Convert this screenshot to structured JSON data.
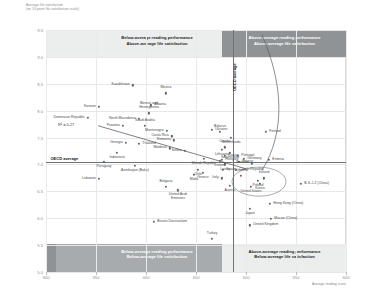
{
  "axis_titles": {
    "y_line1": "Average life satisfaction",
    "y_line2": "(on 10-point life satisfaction scale)",
    "x": "Average reading score"
  },
  "quadrants": {
    "top_left_line1": "Below-average reading performance",
    "top_left_line2": "Above-average life satisfaction",
    "top_right_line1": "Above-average reading performance",
    "top_right_line2": "Above-average life satisfaction",
    "bottom_left_line1": "Below-average reading performance",
    "bottom_left_line2": "Below-average life satisfaction",
    "bottom_right_line1": "Above-average reading performance",
    "bottom_right_line2": "Below-average life satisfaction"
  },
  "reference": {
    "horizontal_label": "OECD average",
    "vertical_label": "OECD average",
    "r_squared_label": "R² = 0.27"
  },
  "chart_data": {
    "type": "scatter",
    "title": "",
    "xlabel": "Average reading score",
    "ylabel": "Average life satisfaction (on 10-point life satisfaction scale)",
    "xlim": [
      300,
      600
    ],
    "ylim": [
      5.0,
      9.5
    ],
    "xticks": [
      300,
      350,
      400,
      450,
      500,
      550,
      600
    ],
    "yticks": [
      5.0,
      5.5,
      6.0,
      6.5,
      7.0,
      7.5,
      8.0,
      8.5,
      9.0,
      9.5
    ],
    "grid": true,
    "legend": "none",
    "oecd_average_x": 487,
    "oecd_average_y": 7.04,
    "trendline": {
      "x0": 352,
      "y0": 7.72,
      "x1": 500,
      "y1": 6.92
    },
    "points": [
      {
        "label": "Kazakhstan",
        "x": 387,
        "y": 8.47,
        "lpos": "r"
      },
      {
        "label": "Mexico",
        "x": 420,
        "y": 8.32,
        "lpos": "c-top"
      },
      {
        "label": "Albania",
        "x": 405,
        "y": 8.1,
        "lpos": "l"
      },
      {
        "label": "Bosnia and Herzegovina",
        "x": 403,
        "y": 7.95,
        "lpos": "c-top2"
      },
      {
        "label": "Kosovo",
        "x": 353,
        "y": 8.07,
        "lpos": "r"
      },
      {
        "label": "Dominican Republic",
        "x": 342,
        "y": 7.87,
        "lpos": "r"
      },
      {
        "label": "North Macedonia",
        "x": 393,
        "y": 7.85,
        "lpos": "r"
      },
      {
        "label": "Panama",
        "x": 377,
        "y": 7.72,
        "lpos": "r"
      },
      {
        "label": "Saudi Arabia",
        "x": 399,
        "y": 7.72,
        "lpos": "c-top2"
      },
      {
        "label": "Montenegro",
        "x": 421,
        "y": 7.63,
        "lpos": "r"
      },
      {
        "label": "Ukraine",
        "x": 466,
        "y": 7.64,
        "lpos": "l"
      },
      {
        "label": "Belarus",
        "x": 474,
        "y": 7.6,
        "lpos": "c-top"
      },
      {
        "label": "Costa Rica",
        "x": 426,
        "y": 7.52,
        "lpos": "r"
      },
      {
        "label": "Romania",
        "x": 428,
        "y": 7.45,
        "lpos": "r"
      },
      {
        "label": "Netherlands",
        "x": 485,
        "y": 7.49,
        "lpos": "c-bot"
      },
      {
        "label": "Georgia",
        "x": 380,
        "y": 7.4,
        "lpos": "r"
      },
      {
        "label": "Thailand",
        "x": 393,
        "y": 7.38,
        "lpos": "l"
      },
      {
        "label": "Finland",
        "x": 520,
        "y": 7.61,
        "lpos": "l"
      },
      {
        "label": "Moldova",
        "x": 424,
        "y": 7.3,
        "lpos": "r"
      },
      {
        "label": "Croatia",
        "x": 479,
        "y": 7.32,
        "lpos": "c-top"
      },
      {
        "label": "Lithuania",
        "x": 476,
        "y": 7.27,
        "lpos": "c-bot"
      },
      {
        "label": "Serbia",
        "x": 439,
        "y": 7.25,
        "lpos": "r"
      },
      {
        "label": "Indonesia",
        "x": 371,
        "y": 7.22,
        "lpos": "c-bot"
      },
      {
        "label": "Switzerland",
        "x": 484,
        "y": 7.21,
        "lpos": "c-bot"
      },
      {
        "label": "Russia",
        "x": 479,
        "y": 7.16,
        "lpos": "l"
      },
      {
        "label": "Portugal",
        "x": 492,
        "y": 7.16,
        "lpos": "l"
      },
      {
        "label": "Hungary",
        "x": 476,
        "y": 7.09,
        "lpos": "l"
      },
      {
        "label": "Estonia",
        "x": 523,
        "y": 7.08,
        "lpos": "l"
      },
      {
        "label": "Germany",
        "x": 498,
        "y": 7.1,
        "lpos": "l"
      },
      {
        "label": "Slovak Republic",
        "x": 458,
        "y": 7.1,
        "lpos": "c-bot2"
      },
      {
        "label": "Iceland",
        "x": 474,
        "y": 7.07,
        "lpos": "c-bot"
      },
      {
        "label": "Latvia",
        "x": 479,
        "y": 7.0,
        "lpos": "c-bot"
      },
      {
        "label": "France",
        "x": 493,
        "y": 7.05,
        "lpos": "l"
      },
      {
        "label": "Sweden",
        "x": 506,
        "y": 7.02,
        "lpos": "r"
      },
      {
        "label": "Paraguay",
        "x": 358,
        "y": 7.05,
        "lpos": "c-bot"
      },
      {
        "label": "Azerbaijan (Baku)",
        "x": 389,
        "y": 6.98,
        "lpos": "c-bot"
      },
      {
        "label": "Lebanon",
        "x": 353,
        "y": 6.73,
        "lpos": "r"
      },
      {
        "label": "Chile",
        "x": 452,
        "y": 6.9,
        "lpos": "c-bot"
      },
      {
        "label": "Greece",
        "x": 457,
        "y": 6.85,
        "lpos": "c-bot"
      },
      {
        "label": "Malta",
        "x": 448,
        "y": 6.8,
        "lpos": "c-bot"
      },
      {
        "label": "Spain",
        "x": 477,
        "y": 6.9,
        "lpos": "l"
      },
      {
        "label": "Slovenia",
        "x": 495,
        "y": 6.79,
        "lpos": "c-top"
      },
      {
        "label": "Italy",
        "x": 476,
        "y": 6.74,
        "lpos": "r"
      },
      {
        "label": "Czech Republic",
        "x": 490,
        "y": 6.9,
        "lpos": "l"
      },
      {
        "label": "B-S-J-Z (China)",
        "x": 555,
        "y": 6.64,
        "lpos": "l"
      },
      {
        "label": "Poland",
        "x": 512,
        "y": 6.69,
        "lpos": "c-bot"
      },
      {
        "label": "Korea",
        "x": 514,
        "y": 6.64,
        "lpos": "c-bot"
      },
      {
        "label": "United States",
        "x": 505,
        "y": 6.58,
        "lpos": "c-bot"
      },
      {
        "label": "Ireland",
        "x": 518,
        "y": 6.74,
        "lpos": "c-top"
      },
      {
        "label": "Austria",
        "x": 484,
        "y": 6.6,
        "lpos": "c-bot"
      },
      {
        "label": "United Arab Emirates",
        "x": 432,
        "y": 6.52,
        "lpos": "c-bot2"
      },
      {
        "label": "Bulgaria",
        "x": 420,
        "y": 6.58,
        "lpos": "c-top"
      },
      {
        "label": "Hong Kong (China)",
        "x": 524,
        "y": 6.27,
        "lpos": "l"
      },
      {
        "label": "Japan",
        "x": 504,
        "y": 6.18,
        "lpos": "c-bot"
      },
      {
        "label": "Macao (China)",
        "x": 525,
        "y": 5.99,
        "lpos": "l"
      },
      {
        "label": "United Kingdom",
        "x": 504,
        "y": 5.87,
        "lpos": "l"
      },
      {
        "label": "Brunei Darussalam",
        "x": 408,
        "y": 5.93,
        "lpos": "l"
      },
      {
        "label": "Turkey",
        "x": 466,
        "y": 5.62,
        "lpos": "c-top"
      }
    ]
  }
}
